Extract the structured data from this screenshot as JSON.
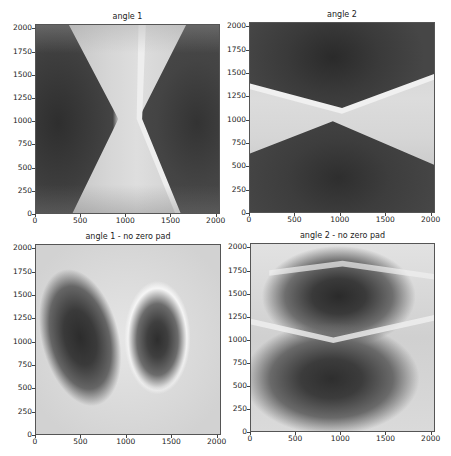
{
  "figure": {
    "layout": "2x2 grid",
    "colormap": "grayscale"
  },
  "chart_data": [
    {
      "type": "heatmap",
      "title": "angle 1",
      "xlabel": "",
      "ylabel": "",
      "xlim": [
        0,
        2048
      ],
      "ylim": [
        0,
        2048
      ],
      "xticks": [
        "0",
        "500",
        "1000",
        "1500",
        "2000"
      ],
      "yticks": [
        "0",
        "250",
        "500",
        "750",
        "1000",
        "1250",
        "1500",
        "1750",
        "2000"
      ],
      "description": "Dark lobes on left and right separated by a bright hourglass-shaped band centered near x≈950, narrowest at y≈1050."
    },
    {
      "type": "heatmap",
      "title": "angle 2",
      "xlabel": "",
      "ylabel": "",
      "xlim": [
        0,
        2048
      ],
      "ylim": [
        0,
        2048
      ],
      "xticks": [
        "0",
        "500",
        "1000",
        "1500",
        "2000"
      ],
      "yticks": [
        "0",
        "250",
        "500",
        "750",
        "1000",
        "1250",
        "1500",
        "1750",
        "2000"
      ],
      "description": "Dark lobes on top and bottom separated by a bright horizontal hourglass band centered near y≈1050, narrowest at x≈950."
    },
    {
      "type": "heatmap",
      "title": "angle 1 - no zero pad",
      "xlabel": "",
      "ylabel": "",
      "xlim": [
        0,
        2048
      ],
      "ylim": [
        0,
        2048
      ],
      "xticks": [
        "0",
        "500",
        "1000",
        "1500",
        "2000"
      ],
      "yticks": [
        "0",
        "250",
        "500",
        "750",
        "1000",
        "1250",
        "1500",
        "1750",
        "2000"
      ],
      "description": "Light background with two dark elliptical blobs: left centered near (500,1050), right centered near (1300,1000) with bright halo rim."
    },
    {
      "type": "heatmap",
      "title": "angle 2 - no zero pad",
      "xlabel": "",
      "ylabel": "",
      "xlim": [
        0,
        2048
      ],
      "ylim": [
        0,
        2048
      ],
      "xticks": [
        "0",
        "500",
        "1000",
        "1500",
        "2000"
      ],
      "yticks": [
        "0",
        "250",
        "500",
        "750",
        "1000",
        "1250",
        "1500",
        "1750",
        "2000"
      ],
      "description": "Light background with two dark blobs: upper centered near (950,1350), lower broad blob centered near (900,600); bright wavy bands separate them."
    }
  ],
  "panels": [
    {
      "title": "angle 1"
    },
    {
      "title": "angle 2"
    },
    {
      "title": "angle 1 - no zero pad"
    },
    {
      "title": "angle 2 - no zero pad"
    }
  ],
  "axes": {
    "xticks": [
      "0",
      "500",
      "1000",
      "1500",
      "2000"
    ],
    "yticks": [
      "0",
      "250",
      "500",
      "750",
      "1000",
      "1250",
      "1500",
      "1750",
      "2000"
    ]
  }
}
